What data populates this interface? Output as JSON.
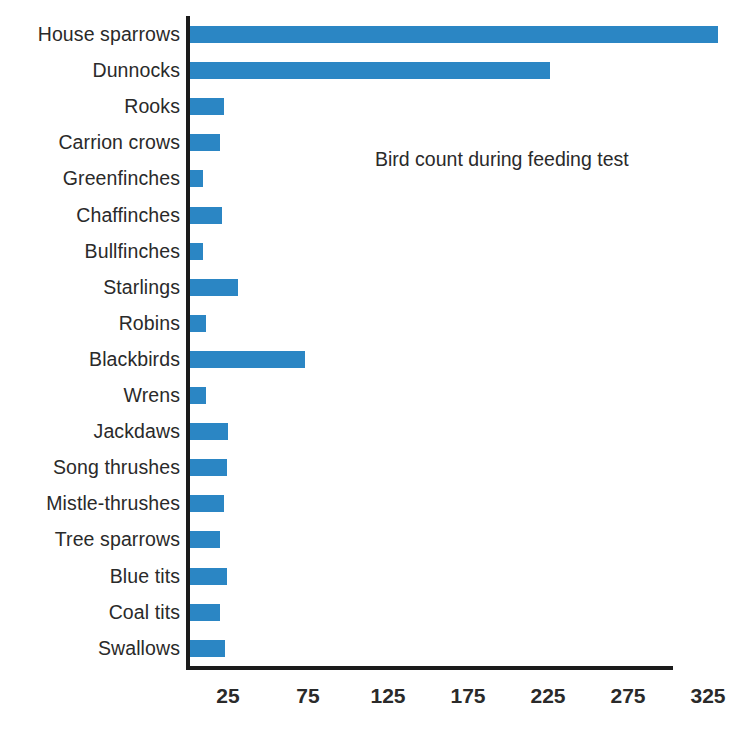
{
  "chart_data": {
    "type": "bar",
    "orientation": "horizontal",
    "title": "Bird count during feeding test",
    "xlabel": "",
    "ylabel": "",
    "xlim": [
      0,
      350
    ],
    "xticks": [
      25,
      75,
      125,
      175,
      225,
      275,
      325
    ],
    "grid": false,
    "legend": null,
    "bar_color": "#2b86c4",
    "axis_color": "#1b1b1b",
    "text_color": "#2a2a2a",
    "background": "#ffffff",
    "categories": [
      "House sparrows",
      "Dunnocks",
      "Rooks",
      "Carrion crows",
      "Greenfinches",
      "Chaffinches",
      "Bullfinches",
      "Starlings",
      "Robins",
      "Blackbirds",
      "Wrens",
      "Jackdaws",
      "Song thrushes",
      "Mistle-thrushes",
      "Tree sparrows",
      "Blue tits",
      "Coal tits",
      "Swallows"
    ],
    "values": [
      330,
      225,
      21,
      19,
      8,
      20,
      8,
      30,
      10,
      72,
      10,
      24,
      23,
      21,
      19,
      23,
      19,
      22
    ]
  }
}
